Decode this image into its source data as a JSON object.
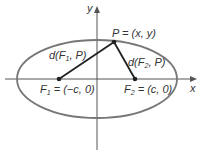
{
  "diagram": {
    "axes": {
      "x_label": "x",
      "y_label": "y"
    },
    "point_P": {
      "label": "P = (x, y)"
    },
    "focus_1": {
      "label_F": "F",
      "label_sub": "1",
      "label_rest": " = (−c, 0)"
    },
    "focus_2": {
      "label_F": "F",
      "label_sub": "2",
      "label_rest": " = (c, 0)"
    },
    "distance_1": {
      "prefix": "d(F",
      "sub": "1",
      "suffix": ", P)"
    },
    "distance_2": {
      "prefix": "d(F",
      "sub": "2",
      "suffix": ", P)"
    },
    "colors": {
      "ellipse": "#777777",
      "axes": "#555555",
      "segments": "#222222",
      "points": "#222222"
    }
  }
}
